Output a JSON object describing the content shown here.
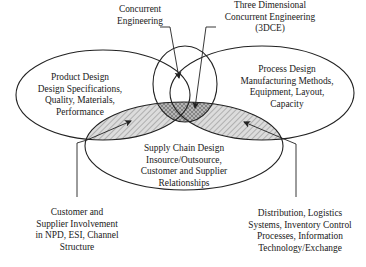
{
  "diagram": {
    "title": "Three Dimensional Concurrent Engineering",
    "colors": {
      "stroke": "#222222",
      "hatch_fill": "#d9d9d9",
      "hatch_line": "#8a8a8a",
      "center_fill": "#a9a9a9",
      "text": "#1a1a1a",
      "background": "#ffffff"
    },
    "circles": {
      "product": {
        "lines": [
          "Product Design",
          "Design Specifications,",
          "Quality, Materials,",
          "Performance"
        ]
      },
      "process": {
        "lines": [
          "Process Design",
          "Manufacturing Methods,",
          "Equipment, Layout,",
          "Capacity"
        ]
      },
      "supply": {
        "lines": [
          "Supply Chain Design",
          "Insource/Outsource,",
          "Customer and Supplier",
          "Relationships"
        ]
      }
    },
    "callouts": {
      "concurrent_engineering": {
        "lines": [
          "Concurrent",
          "Engineering"
        ]
      },
      "three_dce": {
        "lines": [
          "Three Dimensional",
          "Concurrent Engineering",
          "(3DCE)"
        ]
      },
      "customer_supplier": {
        "lines": [
          "Customer and",
          "Supplier Involvement",
          "in NPD, ESI, Channel",
          "Structure"
        ]
      },
      "distribution": {
        "lines": [
          "Distribution, Logistics",
          "Systems, Inventory Control",
          "Processes, Information",
          "Technology/Exchange"
        ]
      }
    }
  }
}
